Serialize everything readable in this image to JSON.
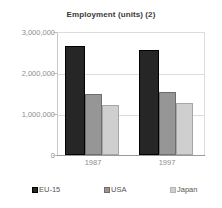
{
  "chart_data": {
    "type": "bar",
    "title": "Employment (units) (2)",
    "xlabel": "",
    "ylabel": "",
    "categories": [
      "1987",
      "1997"
    ],
    "series": [
      {
        "name": "EU-15",
        "values": [
          2660000,
          2560000
        ],
        "color": "#262626"
      },
      {
        "name": "USA",
        "values": [
          1490000,
          1540000
        ],
        "color": "#969696"
      },
      {
        "name": "Japan",
        "values": [
          1220000,
          1270000
        ],
        "color": "#cfcfcf"
      }
    ],
    "ylim": [
      0,
      3000000
    ],
    "ytick_labels": [
      "0",
      "1,000,000",
      "2,000,000",
      "3,000,000"
    ],
    "ytick_values": [
      0,
      1000000,
      2000000,
      3000000
    ],
    "grid": true,
    "legend_position": "bottom"
  },
  "legend": {
    "items": [
      {
        "label": "EU-15"
      },
      {
        "label": "USA"
      },
      {
        "label": "Japan"
      }
    ]
  }
}
